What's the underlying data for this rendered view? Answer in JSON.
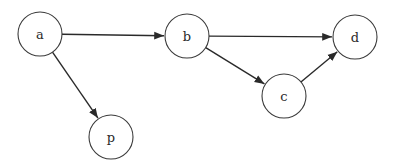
{
  "diagram": {
    "type": "directed-graph",
    "nodes": [
      {
        "id": "a",
        "label": "a",
        "cx": 40,
        "cy": 34,
        "r": 22
      },
      {
        "id": "b",
        "label": "b",
        "cx": 187,
        "cy": 36,
        "r": 22
      },
      {
        "id": "d",
        "label": "d",
        "cx": 355,
        "cy": 37,
        "r": 22
      },
      {
        "id": "c",
        "label": "c",
        "cx": 284,
        "cy": 96,
        "r": 22
      },
      {
        "id": "p",
        "label": "p",
        "cx": 111,
        "cy": 137,
        "r": 22
      }
    ],
    "edges": [
      {
        "from": "a",
        "to": "b"
      },
      {
        "from": "a",
        "to": "p"
      },
      {
        "from": "b",
        "to": "d"
      },
      {
        "from": "b",
        "to": "c"
      },
      {
        "from": "c",
        "to": "d"
      }
    ],
    "colors": {
      "stroke": "#2a2a2a",
      "background": "#ffffff"
    }
  }
}
